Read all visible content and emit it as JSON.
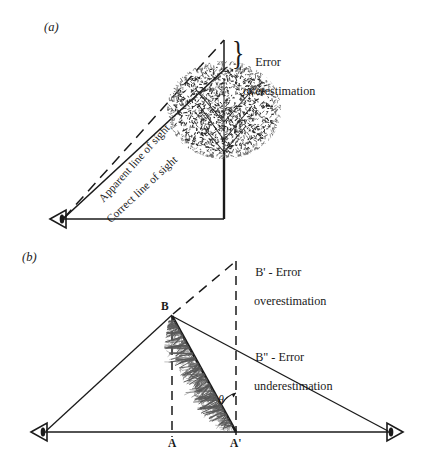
{
  "figure": {
    "background_color": "#ffffff",
    "ink_color": "#1a1a1a",
    "foliage_color": "#3a3a3a",
    "panels": [
      {
        "letter": "(a)",
        "description": "Observer viewing a vertical broadleaf tree; apparent line of sight above correct line of sight causes height overestimation",
        "labels": {
          "error_line1": "Error",
          "error_line2": "overestimation",
          "apparent_line_of_sight": "Apparent line of sight",
          "correct_line_of_sight": "Correct line of sight"
        },
        "icons": [
          "eye-icon"
        ]
      },
      {
        "letter": "(b)",
        "description": "Leaning tree BA' seen from two opposite observers; projecting the lean gives B' overestimate or B\" underestimate of height",
        "labels": {
          "b_prime_line1": "B' - Error",
          "b_prime_line2": "overestimation",
          "b_double_prime_line1": "B\" - Error",
          "b_double_prime_line2": "underestimation",
          "apex": "B",
          "base_vertical": "A",
          "base_lean": "A'",
          "angle": "θ"
        },
        "icons": [
          "eye-icon-left",
          "eye-icon-right"
        ]
      }
    ]
  },
  "chart_data": {
    "type": "diagram",
    "title": "",
    "subtitle": "",
    "xlabel": "",
    "ylabel": "",
    "grid": false,
    "legend_position": "none",
    "panels": [
      {
        "id": "a",
        "label": "(a)",
        "annotations": [
          "Error overestimation",
          "Apparent line of sight",
          "Correct line of sight"
        ],
        "points": {
          "observer_eye": [
            62,
            218
          ],
          "tree_base": [
            224,
            218
          ],
          "crown_top": [
            224,
            68
          ],
          "apparent_top": [
            224,
            40
          ]
        },
        "segments": [
          {
            "name": "ground-line",
            "from": [
              62,
              218
            ],
            "to": [
              224,
              218
            ],
            "style": "solid"
          },
          {
            "name": "trunk",
            "from": [
              224,
              218
            ],
            "to": [
              224,
              140
            ],
            "style": "solid"
          },
          {
            "name": "correct-line-of-sight",
            "from": [
              62,
              218
            ],
            "to": [
              224,
              68
            ],
            "style": "solid"
          },
          {
            "name": "apparent-line-of-sight",
            "from": [
              62,
              218
            ],
            "to": [
              224,
              40
            ],
            "style": "dashed"
          },
          {
            "name": "error-segment",
            "from": [
              224,
              40
            ],
            "to": [
              224,
              68
            ],
            "style": "solid"
          }
        ]
      },
      {
        "id": "b",
        "label": "(b)",
        "annotations": [
          "B' - Error overestimation",
          "B\" - Error underestimation"
        ],
        "points": {
          "observer_left": [
            42,
            432
          ],
          "observer_right": [
            392,
            432
          ],
          "apex_B": [
            172,
            315
          ],
          "base_A": [
            172,
            432
          ],
          "base_A_prime": [
            236,
            432
          ],
          "B_prime": [
            236,
            262
          ],
          "B_double_prime": [
            236,
            345
          ]
        },
        "segments": [
          {
            "name": "baseline",
            "from": [
              42,
              432
            ],
            "to": [
              392,
              432
            ],
            "style": "solid"
          },
          {
            "name": "left-sight-line",
            "from": [
              42,
              432
            ],
            "to": [
              172,
              315
            ],
            "style": "solid"
          },
          {
            "name": "right-sight-line",
            "from": [
              172,
              315
            ],
            "to": [
              392,
              432
            ],
            "style": "solid"
          },
          {
            "name": "lean-extension-to-Bprime",
            "from": [
              172,
              315
            ],
            "to": [
              236,
              262
            ],
            "style": "dashed"
          },
          {
            "name": "vertical-at-A",
            "from": [
              172,
              315
            ],
            "to": [
              172,
              432
            ],
            "style": "dashed"
          },
          {
            "name": "vertical-at-Aprime",
            "from": [
              236,
              262
            ],
            "to": [
              236,
              432
            ],
            "style": "dashed"
          },
          {
            "name": "leaning-trunk",
            "from": [
              172,
              315
            ],
            "to": [
              236,
              432
            ],
            "style": "solid-thick"
          }
        ],
        "angle_marker": {
          "label": "θ",
          "vertex": [
            236,
            432
          ],
          "position": [
            215,
            398
          ]
        }
      }
    ]
  }
}
